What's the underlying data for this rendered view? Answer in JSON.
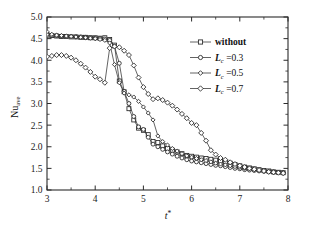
{
  "chart_data": {
    "type": "line",
    "title": "",
    "subtitle": "",
    "xlabel": "t*",
    "ylabel": "Nu_ave",
    "ylabel_base": "Nu",
    "ylabel_sub": "ave",
    "xlabel_base": "t",
    "xlabel_sup": "*",
    "xlim": [
      3,
      8
    ],
    "ylim": [
      1.0,
      5.0
    ],
    "xticks": [
      3,
      4,
      5,
      6,
      7,
      8
    ],
    "xticklabels": [
      "3",
      "4",
      "5",
      "6",
      "7",
      "8"
    ],
    "yticks": [
      1.0,
      1.5,
      2.0,
      2.5,
      3.0,
      3.5,
      4.0,
      4.5,
      5.0
    ],
    "yticklabels": [
      "1.0",
      "1.5",
      "2.0",
      "2.5",
      "3.0",
      "3.5",
      "4.0",
      "4.5",
      "5.0"
    ],
    "xminorticks": [
      3.5,
      4.5,
      5.5,
      6.5,
      7.5
    ],
    "yminorticks": [
      1.25,
      1.75,
      2.25,
      2.75,
      3.25,
      3.75,
      4.25,
      4.75
    ],
    "grid": false,
    "legend_position": "upper right",
    "marker_fill": "#ffffff",
    "line_color": "#303030",
    "series": [
      {
        "name": "without",
        "label": "without",
        "marker": "square",
        "marker_size": 4.0,
        "x": [
          3.0,
          3.1,
          3.2,
          3.3,
          3.4,
          3.5,
          3.6,
          3.7,
          3.8,
          3.9,
          4.0,
          4.1,
          4.2,
          4.3,
          4.4,
          4.5,
          4.6,
          4.7,
          4.8,
          4.9,
          5.0,
          5.1,
          5.2,
          5.3,
          5.4,
          5.5,
          5.6,
          5.7,
          5.8,
          5.9,
          6.0,
          6.1,
          6.2,
          6.3,
          6.4,
          6.5,
          6.6,
          6.7,
          6.8,
          6.9,
          7.0,
          7.1,
          7.2,
          7.3,
          7.4,
          7.5,
          7.6,
          7.7,
          7.8,
          7.9
        ],
        "y": [
          4.58,
          4.57,
          4.56,
          4.55,
          4.55,
          4.54,
          4.54,
          4.53,
          4.53,
          4.52,
          4.52,
          4.51,
          4.52,
          4.48,
          4.35,
          3.52,
          3.27,
          2.88,
          2.62,
          2.43,
          2.38,
          2.28,
          2.12,
          2.1,
          2.02,
          1.96,
          1.92,
          1.88,
          1.84,
          1.8,
          1.78,
          1.76,
          1.74,
          1.73,
          1.71,
          1.69,
          1.67,
          1.65,
          1.62,
          1.59,
          1.56,
          1.53,
          1.51,
          1.49,
          1.47,
          1.45,
          1.44,
          1.42,
          1.41,
          1.4
        ]
      },
      {
        "name": "Lc_0_3",
        "label": "=0.3",
        "label_base": "L",
        "label_sub": "c",
        "marker": "circle",
        "marker_size": 3.9,
        "x": [
          3.0,
          3.1,
          3.2,
          3.3,
          3.4,
          3.5,
          3.6,
          3.7,
          3.8,
          3.9,
          4.0,
          4.1,
          4.2,
          4.3,
          4.4,
          4.5,
          4.6,
          4.7,
          4.8,
          4.9,
          5.0,
          5.1,
          5.2,
          5.3,
          5.4,
          5.5,
          5.6,
          5.7,
          5.8,
          5.9,
          6.0,
          6.1,
          6.2,
          6.3,
          6.4,
          6.5,
          6.6,
          6.7,
          6.8,
          6.9,
          7.0,
          7.1,
          7.2,
          7.3,
          7.4,
          7.5,
          7.6,
          7.7,
          7.8,
          7.9
        ],
        "y": [
          4.6,
          4.58,
          4.57,
          4.56,
          4.55,
          4.55,
          4.54,
          4.54,
          4.53,
          4.52,
          4.51,
          4.5,
          4.49,
          4.46,
          4.32,
          3.93,
          3.28,
          3.0,
          2.7,
          2.46,
          2.4,
          2.22,
          2.06,
          2.0,
          1.94,
          1.88,
          1.83,
          1.78,
          1.74,
          1.7,
          1.67,
          1.65,
          1.63,
          1.61,
          1.59,
          1.57,
          1.56,
          1.54,
          1.52,
          1.5,
          1.49,
          1.47,
          1.46,
          1.45,
          1.44,
          1.43,
          1.42,
          1.41,
          1.4,
          1.39
        ]
      },
      {
        "name": "Lc_0_5",
        "label": "=0.5",
        "label_base": "L",
        "label_sub": "c",
        "marker": "diamond",
        "marker_size": 4.1,
        "x": [
          3.0,
          3.1,
          3.2,
          3.3,
          3.4,
          3.5,
          3.6,
          3.7,
          3.8,
          3.9,
          4.0,
          4.1,
          4.2,
          4.3,
          4.4,
          4.5,
          4.6,
          4.7,
          4.8,
          4.9,
          5.0,
          5.1,
          5.2,
          5.3,
          5.4,
          5.5,
          5.6,
          5.7,
          5.8,
          5.9,
          6.0,
          6.1,
          6.2,
          6.3,
          6.4,
          6.5,
          6.6,
          6.7,
          6.8,
          6.9,
          7.0,
          7.1,
          7.2,
          7.3,
          7.4,
          7.5,
          7.6,
          7.7,
          7.8,
          7.9
        ],
        "y": [
          4.66,
          4.6,
          4.58,
          4.57,
          4.56,
          4.55,
          4.54,
          4.53,
          4.52,
          4.51,
          4.5,
          4.48,
          4.46,
          4.4,
          3.9,
          3.48,
          3.24,
          3.2,
          3.15,
          3.05,
          2.92,
          2.78,
          2.62,
          2.25,
          2.12,
          2.04,
          1.96,
          1.9,
          1.84,
          1.79,
          1.76,
          1.73,
          1.7,
          1.68,
          1.65,
          1.62,
          1.6,
          1.58,
          1.56,
          1.54,
          1.52,
          1.5,
          1.49,
          1.47,
          1.46,
          1.45,
          1.43,
          1.42,
          1.41,
          1.4
        ]
      },
      {
        "name": "Lc_0_7",
        "label": "=0.7",
        "label_base": "L",
        "label_sub": "c",
        "marker": "diamond",
        "marker_size": 5.0,
        "x": [
          3.0,
          3.1,
          3.2,
          3.3,
          3.4,
          3.5,
          3.6,
          3.7,
          3.8,
          3.9,
          4.0,
          4.1,
          4.2,
          4.3,
          4.4,
          4.5,
          4.6,
          4.7,
          4.8,
          4.9,
          5.0,
          5.1,
          5.2,
          5.3,
          5.4,
          5.5,
          5.6,
          5.7,
          5.8,
          5.9,
          6.0,
          6.1,
          6.2,
          6.3,
          6.4,
          6.5,
          6.6,
          6.7,
          6.8,
          6.9,
          7.0,
          7.1,
          7.2,
          7.3,
          7.4,
          7.5,
          7.6,
          7.7,
          7.8,
          7.9
        ],
        "y": [
          4.08,
          4.1,
          4.12,
          4.12,
          4.1,
          4.06,
          4.0,
          3.92,
          3.83,
          3.73,
          3.62,
          3.56,
          3.48,
          4.28,
          4.32,
          4.3,
          4.22,
          4.12,
          3.88,
          3.6,
          3.38,
          3.22,
          3.1,
          3.12,
          3.08,
          3.02,
          2.95,
          2.86,
          2.76,
          2.66,
          2.55,
          2.5,
          2.32,
          2.14,
          1.92,
          1.82,
          1.74,
          1.7,
          1.64,
          1.6,
          1.56,
          1.53,
          1.5,
          1.48,
          1.46,
          1.44,
          1.42,
          1.41,
          1.4,
          1.39
        ]
      }
    ],
    "legend": [
      {
        "label": "without",
        "marker": "square"
      },
      {
        "label": "=0.3",
        "base": "L",
        "sub": "c",
        "marker": "circle"
      },
      {
        "label": "=0.5",
        "base": "L",
        "sub": "c",
        "marker": "diamond"
      },
      {
        "label": "=0.7",
        "base": "L",
        "sub": "c",
        "marker": "diamond"
      }
    ]
  }
}
